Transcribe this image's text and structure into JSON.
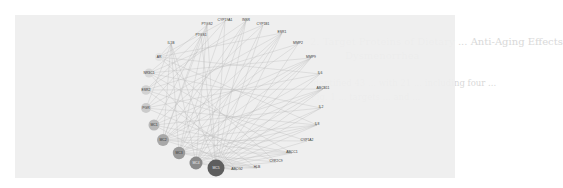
{
  "background_text": {
    "heading_line1": "2.  Target Proteins of Dietary ... Anti-Aging Effects",
    "heading_line2": "Dysmenorrhea",
    "para_line1": "... identified 43 ... with 21 ... including four ...",
    "para_line2": "... Fig. 1 ... targets ... and ..."
  },
  "figure": {
    "type": "network",
    "layout": "circular",
    "background": "#eeeeee",
    "edge_color": "#b9b9b9",
    "text_nodes": [
      {
        "label": "IL1B",
        "x": 171,
        "y": 44
      },
      {
        "label": "PTGS1",
        "x": 201,
        "y": 36
      },
      {
        "label": "PTGS2",
        "x": 207,
        "y": 25
      },
      {
        "label": "CYP19A1",
        "x": 225,
        "y": 21
      },
      {
        "label": "INSR",
        "x": 246,
        "y": 21
      },
      {
        "label": "CYP1B1",
        "x": 263,
        "y": 25
      },
      {
        "label": "ESR1",
        "x": 282,
        "y": 33
      },
      {
        "label": "MMP2",
        "x": 298,
        "y": 44
      },
      {
        "label": "MMP9",
        "x": 311,
        "y": 58
      },
      {
        "label": "IL6",
        "x": 320,
        "y": 74
      },
      {
        "label": "ABCB11",
        "x": 323,
        "y": 89
      },
      {
        "label": "IL2",
        "x": 321,
        "y": 108
      },
      {
        "label": "IL8",
        "x": 317,
        "y": 125
      },
      {
        "label": "CYP1A2",
        "x": 307,
        "y": 141
      },
      {
        "label": "ABCC1",
        "x": 292,
        "y": 153
      },
      {
        "label": "CYP2C9",
        "x": 276,
        "y": 162
      },
      {
        "label": "HLB",
        "x": 257,
        "y": 168
      },
      {
        "label": "ABCG2",
        "x": 237,
        "y": 170
      }
    ],
    "circle_nodes": [
      {
        "label": "AR",
        "x": 159,
        "y": 57,
        "r": 4,
        "fill": "#e3e3e3"
      },
      {
        "label": "NR3C1",
        "x": 149,
        "y": 73,
        "r": 4.5,
        "fill": "#d9d9d9"
      },
      {
        "label": "ESR2",
        "x": 146,
        "y": 90,
        "r": 4.8,
        "fill": "#d2d2d2"
      },
      {
        "label": "PGR",
        "x": 146,
        "y": 108,
        "r": 5,
        "fill": "#cbcbcb"
      },
      {
        "label": "MC1",
        "x": 154,
        "y": 125,
        "r": 5.5,
        "fill": "#b9b9b9"
      },
      {
        "label": "MC2",
        "x": 163,
        "y": 140,
        "r": 6,
        "fill": "#a8a8a8"
      },
      {
        "label": "MC3",
        "x": 179,
        "y": 153,
        "r": 6.2,
        "fill": "#9a9a9a"
      },
      {
        "label": "MC4",
        "x": 196,
        "y": 163,
        "r": 6.5,
        "fill": "#8a8a8a"
      },
      {
        "label": "MC5",
        "x": 216,
        "y": 168,
        "r": 8.5,
        "fill": "#5e5e5e"
      }
    ]
  }
}
